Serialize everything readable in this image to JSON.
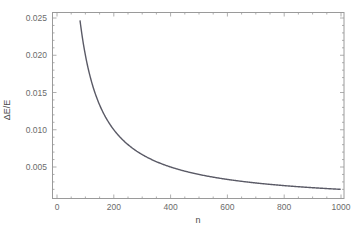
{
  "chart_data": {
    "type": "line",
    "title": "",
    "xlabel": "n",
    "ylabel": "ΔE/E",
    "xlim": [
      -20,
      1010
    ],
    "ylim": [
      0.0018,
      0.0259
    ],
    "xticks": [
      0,
      200,
      400,
      600,
      800,
      1000
    ],
    "xtick_labels": [
      "0",
      "200",
      "400",
      "600",
      "800",
      "1000"
    ],
    "yticks": [
      0.005,
      0.01,
      0.015,
      0.02,
      0.025
    ],
    "ytick_labels": [
      "0.005",
      "0.010",
      "0.015",
      "0.020",
      "0.025"
    ],
    "grid": false,
    "frame": true,
    "legend": null,
    "series": [
      {
        "name": "ΔE/E",
        "color": "#5a5a66",
        "formula_estimate": "2/n",
        "x": [
          81,
          90,
          100,
          120,
          140,
          160,
          180,
          200,
          250,
          300,
          350,
          400,
          450,
          500,
          600,
          700,
          800,
          900,
          1000
        ],
        "y": [
          0.0247,
          0.0222,
          0.02,
          0.0167,
          0.0143,
          0.0125,
          0.0111,
          0.01,
          0.008,
          0.0067,
          0.0057,
          0.005,
          0.0044,
          0.004,
          0.0033,
          0.0029,
          0.0025,
          0.0022,
          0.002
        ]
      }
    ]
  },
  "colors": {
    "frame": "#9a9a9a",
    "tick_label": "#6b6b6b",
    "curve": "#5a5a66"
  }
}
